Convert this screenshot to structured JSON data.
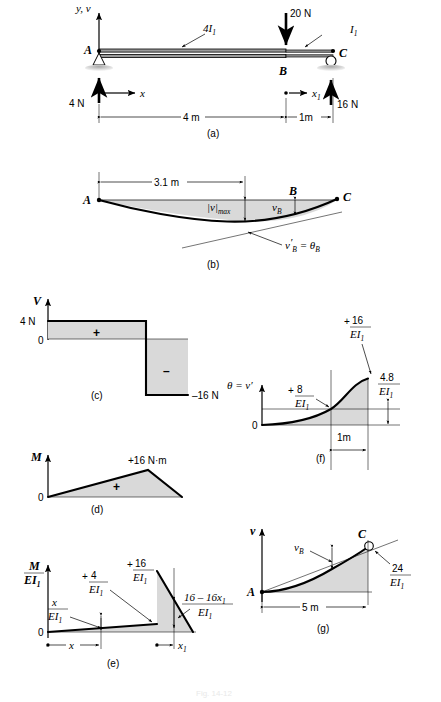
{
  "figure": {
    "caption": "Fig. 14-12",
    "panel_tags": {
      "a": "(a)",
      "b": "(b)",
      "c": "(c)",
      "d": "(d)",
      "e": "(e)",
      "f": "(f)",
      "g": "(g)"
    }
  },
  "panel_a": {
    "name": "beam-loading-diagram",
    "axis_label": "y, v",
    "x_axis_label": "x",
    "x1_axis_label": "x",
    "x1_subscript": "1",
    "supports": {
      "pin_label": "A",
      "mid_label": "B",
      "roller_label": "C"
    },
    "segment_left_inertia": "4I",
    "segment_left_inertia_sub": "1",
    "segment_right_inertia": "I",
    "segment_right_inertia_sub": "1",
    "load_applied": "20 N",
    "reaction_left": "4 N",
    "reaction_right": "16 N",
    "dim_left": "4 m",
    "dim_right": "1m"
  },
  "panel_b": {
    "name": "elastic-curve-diagram",
    "dim_to_max": "3.1 m",
    "point_a": "A",
    "point_b": "B",
    "point_c": "C",
    "vmax_label": "|v|",
    "vmax_sub": "max",
    "vb_label": "v",
    "vb_sub": "B",
    "slope_label_main": "v",
    "slope_label_prime": "′",
    "slope_label_sub": "B",
    "slope_label_eq": " = ",
    "slope_label_theta": "θ",
    "slope_label_theta_sub": "B"
  },
  "panel_c": {
    "name": "shear-diagram",
    "axis_label": "V",
    "value_top": "4 N",
    "value_zero": "0",
    "value_bottom": "–16 N",
    "sign_positive": "+",
    "sign_negative": "–",
    "chart_note": "shear force V(x) step diagram"
  },
  "panel_d": {
    "name": "moment-diagram",
    "axis_label": "M",
    "value_zero": "0",
    "value_peak": "+16 N·m",
    "sign_positive": "+"
  },
  "panel_e": {
    "name": "moment-over-ei-diagram",
    "axis_num": "M",
    "axis_den_e": "EI",
    "axis_den_sub": "1",
    "value_zero": "0",
    "peak_left_sign": "+",
    "peak_left_num": "4",
    "peak_left_den_e": "EI",
    "peak_left_den_sub": "1",
    "peak_right_sign": "+",
    "peak_right_num": "16",
    "peak_right_den_e": "EI",
    "peak_right_den_sub": "1",
    "slope_expr_num": "x",
    "slope_expr_den_e": "EI",
    "slope_expr_den_sub": "1",
    "right_expr_num": "16 – 16x",
    "right_expr_num_sub": "1",
    "right_expr_den_e": "EI",
    "right_expr_den_sub": "1",
    "dim_x": "x",
    "dim_x1": "x",
    "dim_x1_sub": "1"
  },
  "panel_f": {
    "name": "slope-diagram",
    "axis_label_theta": "θ",
    "axis_label_eq": " = ",
    "axis_label_vprime": "v′",
    "value_zero": "0",
    "mid_sign": "+",
    "mid_num": "8",
    "mid_den_e": "EI",
    "mid_den_sub": "1",
    "peak_sign": "+",
    "peak_num": "16",
    "peak_den_e": "EI",
    "peak_den_sub": "1",
    "right_num": "4.8",
    "right_den_e": "EI",
    "right_den_sub": "1",
    "dim_1m": "1m"
  },
  "panel_g": {
    "name": "deflection-diagram",
    "axis_label": "v",
    "point_a": "A",
    "point_c": "C",
    "vb_label": "v",
    "vb_sub": "B",
    "value_num": "24",
    "value_den_e": "EI",
    "value_den_sub": "1",
    "dim_span": "5 m"
  },
  "colors": {
    "shade": "#d9d9d9",
    "stroke": "#000000",
    "background": "#ffffff"
  }
}
